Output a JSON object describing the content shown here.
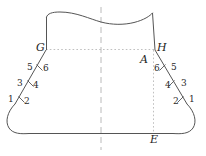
{
  "figure": {
    "title": "",
    "background_color": "#ffffff",
    "stroke_color": "#555555",
    "dash_color": "#999999",
    "label_color": "#1d1d1d",
    "points": {
      "G": "G",
      "H": "H",
      "A": "A",
      "E": "E"
    },
    "left_ticks": [
      {
        "id": "l1",
        "label": "1"
      },
      {
        "id": "l2",
        "label": "2"
      },
      {
        "id": "l3",
        "label": "3"
      },
      {
        "id": "l4",
        "label": "4"
      },
      {
        "id": "l5",
        "label": "5"
      },
      {
        "id": "l6",
        "label": "6"
      }
    ],
    "right_ticks": [
      {
        "id": "r1",
        "label": "1"
      },
      {
        "id": "r2",
        "label": "2"
      },
      {
        "id": "r3",
        "label": "3"
      },
      {
        "id": "r4",
        "label": "4"
      },
      {
        "id": "r5",
        "label": "5"
      },
      {
        "id": "r6",
        "label": "6"
      }
    ]
  }
}
